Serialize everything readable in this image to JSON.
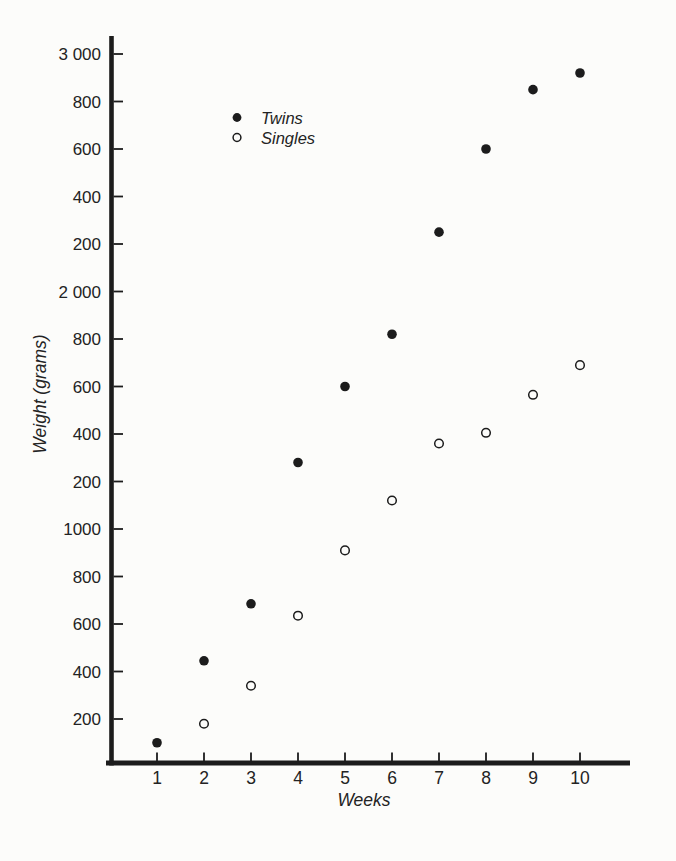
{
  "page": {
    "kind": "scanned textbook scatter chart",
    "paper_color": "#fcfcfa",
    "ink_color": "#1c1c1c"
  },
  "chart_data": {
    "type": "scatter",
    "title": "",
    "xlabel": "Weeks",
    "ylabel": "Weight (grams)",
    "xlim": [
      0,
      11.1
    ],
    "ylim": [
      0,
      3070
    ],
    "grid": false,
    "x_ticks": [
      {
        "value": 1,
        "label": "1"
      },
      {
        "value": 2,
        "label": "2"
      },
      {
        "value": 3,
        "label": "3"
      },
      {
        "value": 4,
        "label": "4"
      },
      {
        "value": 5,
        "label": "5"
      },
      {
        "value": 6,
        "label": "6"
      },
      {
        "value": 7,
        "label": "7"
      },
      {
        "value": 8,
        "label": "8"
      },
      {
        "value": 9,
        "label": "9"
      },
      {
        "value": 10,
        "label": "10"
      }
    ],
    "y_ticks": [
      {
        "value": 200,
        "label": "200"
      },
      {
        "value": 400,
        "label": "400"
      },
      {
        "value": 600,
        "label": "600"
      },
      {
        "value": 800,
        "label": "800"
      },
      {
        "value": 1000,
        "label": "1000"
      },
      {
        "value": 1200,
        "label": "200"
      },
      {
        "value": 1400,
        "label": "400"
      },
      {
        "value": 1600,
        "label": "600"
      },
      {
        "value": 1800,
        "label": "800"
      },
      {
        "value": 2000,
        "label": "2 000"
      },
      {
        "value": 2200,
        "label": "200"
      },
      {
        "value": 2400,
        "label": "400"
      },
      {
        "value": 2600,
        "label": "600"
      },
      {
        "value": 2800,
        "label": "800"
      },
      {
        "value": 3000,
        "label": "3 000"
      }
    ],
    "legend": {
      "position": "inside-upper-left",
      "entries": [
        {
          "label": "Twins",
          "marker": "filled-circle"
        },
        {
          "label": "Singles",
          "marker": "open-circle"
        }
      ]
    },
    "series": [
      {
        "name": "Twins",
        "marker": "filled-circle",
        "points": [
          {
            "week": 1,
            "grams": 100
          },
          {
            "week": 2,
            "grams": 445
          },
          {
            "week": 3,
            "grams": 685
          },
          {
            "week": 4,
            "grams": 1280
          },
          {
            "week": 5,
            "grams": 1600
          },
          {
            "week": 6,
            "grams": 1820
          },
          {
            "week": 7,
            "grams": 2250
          },
          {
            "week": 8,
            "grams": 2600
          },
          {
            "week": 9,
            "grams": 2850
          },
          {
            "week": 10,
            "grams": 2920
          }
        ]
      },
      {
        "name": "Singles",
        "marker": "open-circle",
        "points": [
          {
            "week": 2,
            "grams": 180
          },
          {
            "week": 3,
            "grams": 340
          },
          {
            "week": 4,
            "grams": 635
          },
          {
            "week": 5,
            "grams": 910
          },
          {
            "week": 6,
            "grams": 1120
          },
          {
            "week": 7,
            "grams": 1360
          },
          {
            "week": 8,
            "grams": 1405
          },
          {
            "week": 9,
            "grams": 1565
          },
          {
            "week": 10,
            "grams": 1690
          }
        ]
      }
    ]
  }
}
